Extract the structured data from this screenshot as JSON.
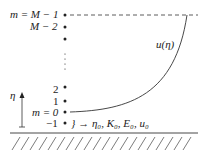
{
  "levels": [
    {
      "label": "m = M − 1",
      "y": 15
    },
    {
      "label": "M − 2",
      "y": 27
    },
    {
      "label": "2",
      "y": 89
    },
    {
      "label": "1",
      "y": 101
    },
    {
      "label": "m = 0",
      "y": 112
    },
    {
      "label": "−1",
      "y": 123
    }
  ],
  "curve_label": "u(η)",
  "axis_label": "η",
  "boundary_annotation": "} → η₀, K₀, E₀, u₀",
  "colors": {
    "ink": "#222222",
    "background": "#ffffff"
  }
}
